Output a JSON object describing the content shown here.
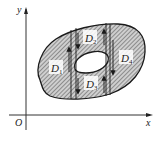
{
  "diagram": {
    "axes": {
      "x_label": "x",
      "y_label": "y",
      "origin_label": "O"
    },
    "regions": [
      {
        "name": "D",
        "sub": "1"
      },
      {
        "name": "D",
        "sub": "2"
      },
      {
        "name": "D",
        "sub": "3"
      },
      {
        "name": "D",
        "sub": "4"
      }
    ],
    "colors": {
      "stroke": "#1a1a1a",
      "hatch": "#555555",
      "fill": "#d9d9d9",
      "hole": "#ffffff"
    }
  }
}
